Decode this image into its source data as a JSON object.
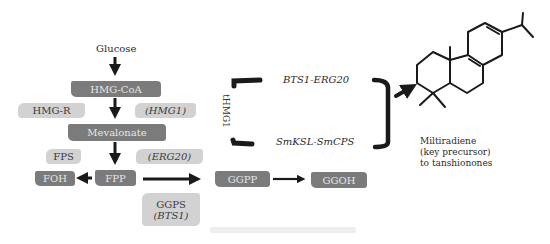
{
  "diagram": {
    "type": "metabolic-pathway",
    "start": "Glucose",
    "nodes_dark": {
      "hmg_coa": "HMG-CoA",
      "mevalonate": "Mevalonate",
      "foh": "FOH",
      "fpp": "FPP",
      "ggpp": "GGPP",
      "ggoh": "GGOH"
    },
    "enzymes_light": {
      "hmg_r": "HMG-R",
      "hmg1": "(HMG1)",
      "fps": "FPS",
      "erg20": "(ERG20)",
      "ggps_line1": "GGPS",
      "ggps_line2": "(BTS1)"
    },
    "engineering": {
      "vertical_label": "tHMG1",
      "fusion_top": "BTS1-ERG20",
      "fusion_bottom": "SmKSL-SmCPS"
    },
    "product": {
      "line1": "Miltiradiene",
      "line2": "(key precursor)",
      "line3": "to tanshionones"
    },
    "edges": [
      [
        "Glucose",
        "HMG-CoA"
      ],
      [
        "HMG-CoA",
        "Mevalonate"
      ],
      [
        "Mevalonate",
        "FPP"
      ],
      [
        "FPP",
        "FOH"
      ],
      [
        "FPP",
        "GGPP"
      ],
      [
        "GGPP",
        "GGOH"
      ],
      [
        "bracket",
        "Miltiradiene"
      ]
    ],
    "colors": {
      "dark_node": "#7b7b7b",
      "light_enzyme": "#d2d2d2",
      "arrow": "#1a1a1a"
    }
  }
}
